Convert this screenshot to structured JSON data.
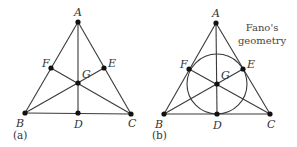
{
  "figure": {
    "title_lines": [
      "Fano's",
      "geometry"
    ],
    "colors": {
      "line": "#3a3a3a",
      "point": "#111111",
      "text": "#333333",
      "background": "#ffffff"
    },
    "panels": [
      {
        "id": "a",
        "caption": "(a)",
        "has_circle": false,
        "points": [
          {
            "name": "A",
            "label": "A",
            "x": 78,
            "y": 22,
            "lx": 74,
            "ly": 16
          },
          {
            "name": "B",
            "label": "B",
            "x": 25,
            "y": 113,
            "lx": 16,
            "ly": 127
          },
          {
            "name": "C",
            "label": "C",
            "x": 131,
            "y": 114,
            "lx": 128,
            "ly": 127
          },
          {
            "name": "D",
            "label": "D",
            "x": 78,
            "y": 113,
            "lx": 74,
            "ly": 128
          },
          {
            "name": "E",
            "label": "E",
            "x": 104,
            "y": 68,
            "lx": 108,
            "ly": 67
          },
          {
            "name": "F",
            "label": "F",
            "x": 51,
            "y": 68,
            "lx": 42,
            "ly": 67
          },
          {
            "name": "G",
            "label": "G",
            "x": 78,
            "y": 83,
            "lx": 82,
            "ly": 78
          }
        ],
        "circle": null
      },
      {
        "id": "b",
        "caption": "(b)",
        "has_circle": true,
        "points": [
          {
            "name": "A",
            "label": "A",
            "x": 216,
            "y": 23,
            "lx": 212,
            "ly": 17
          },
          {
            "name": "B",
            "label": "B",
            "x": 164,
            "y": 114,
            "lx": 155,
            "ly": 128
          },
          {
            "name": "C",
            "label": "C",
            "x": 270,
            "y": 114,
            "lx": 267,
            "ly": 128
          },
          {
            "name": "D",
            "label": "D",
            "x": 217,
            "y": 114,
            "lx": 213,
            "ly": 129
          },
          {
            "name": "E",
            "label": "E",
            "x": 243,
            "y": 69,
            "lx": 247,
            "ly": 68
          },
          {
            "name": "F",
            "label": "F",
            "x": 189,
            "y": 69,
            "lx": 180,
            "ly": 68
          },
          {
            "name": "G",
            "label": "G",
            "x": 217,
            "y": 84,
            "lx": 221,
            "ly": 79
          }
        ],
        "circle": {
          "cx": 217,
          "cy": 84,
          "r": 30
        }
      }
    ],
    "lines": [
      [
        "A",
        "B"
      ],
      [
        "B",
        "C"
      ],
      [
        "C",
        "A"
      ],
      [
        "A",
        "D"
      ],
      [
        "B",
        "E"
      ],
      [
        "C",
        "F"
      ]
    ]
  }
}
